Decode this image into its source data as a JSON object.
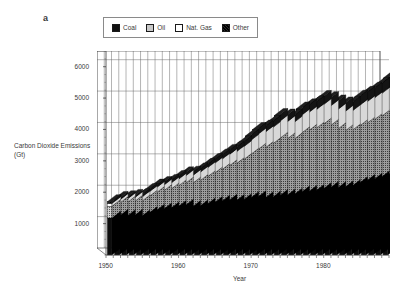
{
  "panel": {
    "label": "a"
  },
  "legend": {
    "position": "top",
    "items": [
      {
        "name": "Coal",
        "key": "coal",
        "swatch": "black-solid"
      },
      {
        "name": "Oil",
        "key": "oil",
        "swatch": "gray-stipple"
      },
      {
        "name": "Nat. Gas",
        "key": "gas",
        "swatch": "white-empty"
      },
      {
        "name": "Other",
        "key": "other",
        "swatch": "dark-hatch"
      }
    ]
  },
  "chart_data": {
    "type": "bar",
    "stacked": true,
    "title": "",
    "xlabel": "Year",
    "ylabel": "Carbon Dioxide Emissions (Gt)",
    "xlim": [
      1949,
      1989
    ],
    "ylim": [
      0,
      6500
    ],
    "yticks": [
      1000,
      2000,
      3000,
      4000,
      5000,
      6000
    ],
    "ytick_labels": [
      "1000",
      "2000",
      "3000",
      "4000",
      "5000",
      "6000"
    ],
    "xticks": [
      1950,
      1960,
      1970,
      1980
    ],
    "xtick_labels": [
      "1950",
      "1960",
      "1970",
      "1980"
    ],
    "grid": true,
    "grid_axis": "both",
    "units": "Gt",
    "categories": [
      1950,
      1951,
      1952,
      1953,
      1954,
      1955,
      1956,
      1957,
      1958,
      1959,
      1960,
      1961,
      1962,
      1963,
      1964,
      1965,
      1966,
      1967,
      1968,
      1969,
      1970,
      1971,
      1972,
      1973,
      1974,
      1975,
      1976,
      1977,
      1978,
      1979,
      1980,
      1981,
      1982,
      1983,
      1984,
      1985,
      1986,
      1987,
      1988
    ],
    "series": [
      {
        "name": "Coal",
        "color": "#111111",
        "values": [
          1180,
          1240,
          1230,
          1240,
          1220,
          1320,
          1400,
          1440,
          1470,
          1520,
          1560,
          1520,
          1540,
          1600,
          1650,
          1690,
          1720,
          1710,
          1740,
          1800,
          1830,
          1800,
          1820,
          1870,
          1880,
          1910,
          1980,
          2000,
          2030,
          2090,
          2130,
          2120,
          2140,
          2180,
          2280,
          2350,
          2390,
          2460,
          2540
        ]
      },
      {
        "name": "Oil",
        "color": "#c9c9c9",
        "values": [
          370,
          400,
          420,
          440,
          470,
          520,
          560,
          580,
          600,
          650,
          700,
          740,
          800,
          860,
          930,
          1000,
          1090,
          1170,
          1270,
          1380,
          1510,
          1590,
          1690,
          1820,
          1790,
          1760,
          1880,
          1940,
          1980,
          2050,
          1970,
          1870,
          1790,
          1770,
          1810,
          1820,
          1890,
          1930,
          1990
        ]
      },
      {
        "name": "Nat. Gas",
        "color": "#ffffff",
        "values": [
          90,
          100,
          110,
          120,
          130,
          145,
          160,
          175,
          190,
          210,
          230,
          245,
          265,
          285,
          310,
          330,
          355,
          380,
          410,
          445,
          480,
          500,
          520,
          545,
          545,
          535,
          565,
          575,
          590,
          620,
          620,
          620,
          615,
          615,
          650,
          680,
          690,
          720,
          760
        ]
      },
      {
        "name": "Other",
        "color": "#2a2a2a",
        "values": [
          60,
          62,
          64,
          66,
          68,
          72,
          76,
          80,
          84,
          90,
          95,
          100,
          105,
          112,
          120,
          128,
          136,
          145,
          155,
          165,
          178,
          186,
          196,
          208,
          212,
          216,
          228,
          238,
          248,
          258,
          262,
          266,
          268,
          274,
          288,
          300,
          312,
          328,
          345
        ]
      }
    ]
  }
}
